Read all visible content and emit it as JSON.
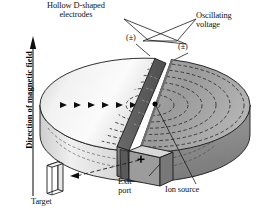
{
  "figure": {
    "type": "cyclotron-cross-section-diagram",
    "background": "#ffffff"
  },
  "labels": {
    "electrodes": "Hollow D-shaped\nelectrodes",
    "oscillating_voltage": "Oscillating\nvoltage",
    "polarity_left": "(±)",
    "polarity_right": "(±)",
    "exit_port": "Exit\nport",
    "ion_source": "Ion source",
    "target": "Target",
    "magnetic_field": "Direction of magnetic field"
  },
  "colors": {
    "outline": "#1a1a1a",
    "dee_left_top": "#f4f4f4",
    "dee_left_top_shade": "#c9c9c9",
    "dee_left_rim": "#e2e2e2",
    "dee_left_cut_face": "#6e6e6e",
    "dee_right_top": "#9c9c9c",
    "dee_right_top_shade": "#b6b6b6",
    "dee_right_rim": "#8a8a8a",
    "gap_band": "#ffffff",
    "exit_box_face": "#9c9c9c",
    "exit_box_top": "#dadada",
    "target_face": "#ffffff",
    "dash_stroke": "#2a2a2a",
    "ion_source_dot": "#000000"
  },
  "geometry": {
    "disk_center_x": 145,
    "disk_center_y": 105,
    "disk_rx": 105,
    "disk_ry": 47,
    "disk_thickness": 30,
    "spiral_arc_count": 7,
    "particle_arrow_count": 6
  },
  "annotations": {
    "field_arrow_direction": "up",
    "beam_arrow_direction": "left",
    "beam_arrow_style": "dashed"
  }
}
